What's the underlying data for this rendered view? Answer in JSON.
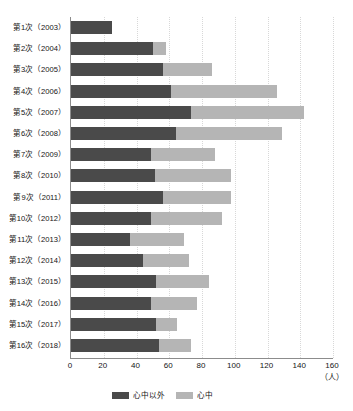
{
  "chart_data": {
    "type": "bar",
    "orientation": "horizontal",
    "stacked": true,
    "title": "",
    "xlabel": "(人)",
    "ylabel": "",
    "xlim": [
      0,
      160
    ],
    "xticks": [
      0,
      20,
      40,
      60,
      80,
      100,
      120,
      140,
      160
    ],
    "grid": true,
    "legend_position": "bottom",
    "categories": [
      "第1次（2003）",
      "第2次（2004）",
      "第3次（2005）",
      "第4次（2006）",
      "第5次（2007）",
      "第6次（2008）",
      "第7次（2009）",
      "第8次（2010）",
      "第9次（2011）",
      "第10次（2012）",
      "第11次（2013）",
      "第12次（2014）",
      "第13次（2015）",
      "第14次（2016）",
      "第15次（2017）",
      "第16次（2018）"
    ],
    "series": [
      {
        "name": "心中以外",
        "color": "#4a4a4a",
        "values": [
          25,
          50,
          56,
          61,
          73,
          64,
          49,
          51,
          56,
          49,
          36,
          44,
          52,
          49,
          52,
          54
        ]
      },
      {
        "name": "心中",
        "color": "#b5b5b5",
        "values": [
          0,
          8,
          30,
          65,
          69,
          65,
          39,
          47,
          42,
          43,
          33,
          28,
          32,
          28,
          13,
          19
        ]
      }
    ],
    "totals": [
      25,
      58,
      86,
      126,
      142,
      129,
      88,
      98,
      98,
      92,
      69,
      72,
      84,
      77,
      65,
      73
    ]
  },
  "legend": {
    "items": [
      {
        "label": "心中以外",
        "color": "#4a4a4a"
      },
      {
        "label": "心中",
        "color": "#b5b5b5"
      }
    ]
  },
  "axis": {
    "unit": "（人）"
  }
}
